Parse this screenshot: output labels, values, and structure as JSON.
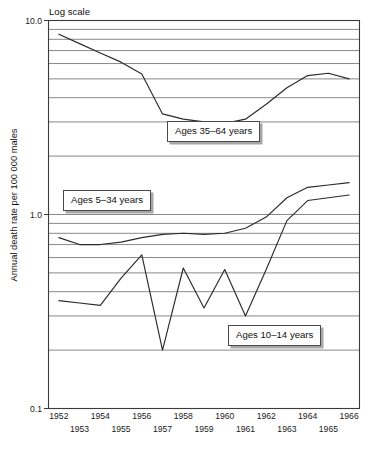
{
  "figure": {
    "scale_note": "Log scale",
    "ylabel": "Annual death rate per 100 000 males"
  },
  "callouts": [
    {
      "name": "ages-35-64",
      "label": "Ages 35–64 years",
      "left": 167,
      "top": 121
    },
    {
      "name": "ages-5-34",
      "label": "Ages 5–34 years",
      "left": 63,
      "top": 190
    },
    {
      "name": "ages-10-14",
      "label": "Ages 10–14 years",
      "left": 228,
      "top": 325
    }
  ],
  "axis": {
    "y_ticks": [
      "10.0",
      "1.0",
      "0.1"
    ],
    "y_tick_values": [
      10.0,
      1.0,
      0.1
    ],
    "y_minor_multipliers": [
      2,
      3,
      4,
      5,
      6,
      7,
      8,
      9
    ],
    "x_top_labels": [
      "1952",
      "1954",
      "1956",
      "1958",
      "1960",
      "1962",
      "1964",
      "1966"
    ],
    "x_bottom_labels": [
      "1953",
      "1955",
      "1957",
      "1959",
      "1961",
      "1963",
      "1965"
    ]
  },
  "chart_data": {
    "type": "line",
    "title": "",
    "xlabel": "",
    "ylabel": "Annual death rate per 100 000 males",
    "yscale": "log",
    "ylim": [
      0.1,
      10.0
    ],
    "xlim": [
      1951.5,
      1966.5
    ],
    "grid": true,
    "legend": "inline-callout-boxes",
    "x": [
      1952,
      1953,
      1954,
      1955,
      1956,
      1957,
      1958,
      1959,
      1960,
      1961,
      1962,
      1963,
      1964,
      1965,
      1966
    ],
    "series": [
      {
        "name": "Ages 35–64 years",
        "values": [
          8.5,
          7.6,
          6.8,
          6.1,
          5.3,
          3.3,
          3.1,
          3.0,
          2.95,
          3.1,
          3.7,
          4.5,
          5.2,
          5.35,
          5.0
        ]
      },
      {
        "name": "Ages 5–34 years",
        "values": [
          0.76,
          0.7,
          0.7,
          0.72,
          0.76,
          0.79,
          0.8,
          0.79,
          0.8,
          0.85,
          0.97,
          1.22,
          1.38,
          1.42,
          1.46
        ]
      },
      {
        "name": "Ages 10–14 years",
        "values": [
          0.36,
          0.35,
          0.34,
          0.47,
          0.62,
          0.2,
          0.53,
          0.33,
          0.52,
          0.3,
          0.52,
          0.93,
          1.18,
          1.22,
          1.26
        ]
      }
    ]
  }
}
